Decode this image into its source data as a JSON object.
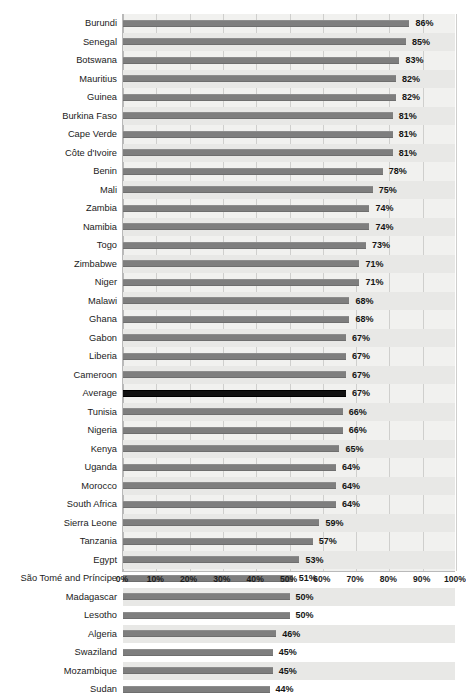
{
  "chart_data": {
    "type": "bar",
    "orientation": "horizontal",
    "title": "",
    "subtitle": "",
    "xlabel": "",
    "ylabel": "",
    "xlim": [
      0,
      100
    ],
    "grid": true,
    "legend": false,
    "value_suffix": "%",
    "highlight_category": "Average",
    "colors": {
      "bar": "#7e7e7e",
      "highlight_bar": "#111111",
      "plot_background": "#f1f1ef",
      "row_band": "#e8e8e6",
      "gridline": "#cfcfcd",
      "text": "#1b1b1b"
    },
    "tick_labels": [
      "0%",
      "10%",
      "20%",
      "30%",
      "40%",
      "50%",
      "60%",
      "70%",
      "80%",
      "90%",
      "100%"
    ],
    "tick_values": [
      0,
      10,
      20,
      30,
      40,
      50,
      60,
      70,
      80,
      90,
      100
    ],
    "categories": [
      "Burundi",
      "Senegal",
      "Botswana",
      "Mauritius",
      "Guinea",
      "Burkina Faso",
      "Cape Verde",
      "Côte d'Ivoire",
      "Benin",
      "Mali",
      "Zambia",
      "Namibia",
      "Togo",
      "Zimbabwe",
      "Niger",
      "Malawi",
      "Ghana",
      "Gabon",
      "Liberia",
      "Cameroon",
      "Average",
      "Tunisia",
      "Nigeria",
      "Kenya",
      "Uganda",
      "Morocco",
      "South Africa",
      "Sierra Leone",
      "Tanzania",
      "Egypt",
      "São Tomé and Príncipe",
      "Madagascar",
      "Lesotho",
      "Algeria",
      "Swaziland",
      "Mozambique",
      "Sudan"
    ],
    "values": [
      86,
      85,
      83,
      82,
      82,
      81,
      81,
      81,
      78,
      75,
      74,
      74,
      73,
      71,
      71,
      68,
      68,
      67,
      67,
      67,
      67,
      66,
      66,
      65,
      64,
      64,
      64,
      59,
      57,
      53,
      51,
      50,
      50,
      46,
      45,
      45,
      44
    ],
    "value_labels": [
      "86%",
      "85%",
      "83%",
      "82%",
      "82%",
      "81%",
      "81%",
      "81%",
      "78%",
      "75%",
      "74%",
      "74%",
      "73%",
      "71%",
      "71%",
      "68%",
      "68%",
      "67%",
      "67%",
      "67%",
      "67%",
      "66%",
      "66%",
      "65%",
      "64%",
      "64%",
      "64%",
      "59%",
      "57%",
      "53%",
      "51%",
      "50%",
      "50%",
      "46%",
      "45%",
      "45%",
      "44%"
    ]
  }
}
